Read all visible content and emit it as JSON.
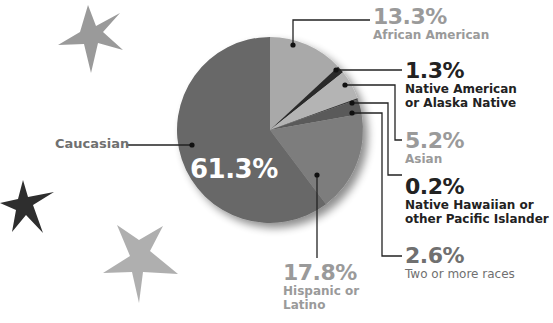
{
  "chart_data": {
    "type": "pie",
    "title": "",
    "categories": [
      "African American",
      "Native American or Alaska Native",
      "Asian",
      "Native Hawaiian or other Pacific Islander",
      "Two or more races",
      "Hispanic or Latino",
      "Caucasian"
    ],
    "values": [
      13.3,
      1.3,
      5.2,
      0.2,
      2.6,
      17.8,
      61.3
    ],
    "colors": [
      "#a9a9a9",
      "#2a2a2a",
      "#b4b4b4",
      "#3a3a3a",
      "#5a5a5a",
      "#7d7d7d",
      "#686868"
    ],
    "unit": "%",
    "legend": "callout labels",
    "start_angle_deg": 0,
    "direction": "clockwise"
  },
  "labels": {
    "african_american": {
      "pct": "13.3%",
      "name": "African American"
    },
    "native_american": {
      "pct": "1.3%",
      "name_line1": "Native American",
      "name_line2": "or Alaska Native"
    },
    "asian": {
      "pct": "5.2%",
      "name": "Asian"
    },
    "native_hawaiian": {
      "pct": "0.2%",
      "name_line1": "Native Hawaiian or",
      "name_line2": "other Pacific Islander"
    },
    "two_or_more": {
      "pct": "2.6%",
      "name": "Two or more races"
    },
    "hispanic": {
      "pct": "17.8%",
      "name_line1": "Hispanic or",
      "name_line2": "Latino"
    },
    "caucasian": {
      "pct": "61.3%",
      "name": "Caucasian"
    }
  }
}
